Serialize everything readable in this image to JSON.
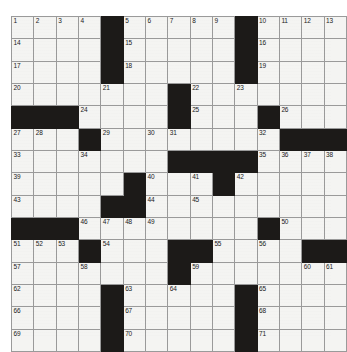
{
  "puzzle": {
    "type": "crossword-grid",
    "rows": 15,
    "cols": 15,
    "colors": {
      "block": "#1c1a18",
      "cell": "#f4f4f2",
      "grid_line": "#9a9a9a",
      "number_text": "#1a1a1a",
      "page_background": "#ffffff"
    },
    "grid": [
      [
        "1",
        "2",
        "3",
        "4",
        "#",
        "5",
        "6",
        "7",
        "8",
        "9",
        "#",
        "10",
        "11",
        "12",
        "13"
      ],
      [
        "14",
        "",
        "",
        "",
        "#",
        "15",
        "",
        "",
        "",
        "",
        "#",
        "16",
        "",
        "",
        ""
      ],
      [
        "17",
        "",
        "",
        "",
        "#",
        "18",
        "",
        "",
        "",
        "",
        "#",
        "19",
        "",
        "",
        ""
      ],
      [
        "20",
        "",
        "",
        "",
        "21",
        "",
        "",
        "#",
        "22",
        "",
        "23",
        "",
        "",
        "",
        ""
      ],
      [
        "#",
        "#",
        "#",
        "24",
        "",
        "",
        "",
        "#",
        "25",
        "",
        "",
        "#",
        "26",
        "",
        ""
      ],
      [
        "27",
        "28",
        "",
        "#",
        "29",
        "",
        "30",
        "31",
        "",
        "",
        "",
        "32",
        "#",
        "#",
        "#"
      ],
      [
        "33",
        "",
        "",
        "34",
        "",
        "",
        "",
        "#",
        "#",
        "#",
        "#",
        "35",
        "36",
        "37",
        "38"
      ],
      [
        "39",
        "",
        "",
        "",
        "",
        "#",
        "40",
        "",
        "41",
        "#",
        "42",
        "",
        "",
        "",
        ""
      ],
      [
        "43",
        "",
        "",
        "",
        "#",
        "#",
        "44",
        "",
        "45",
        "",
        "",
        "",
        "",
        "",
        ""
      ],
      [
        "#",
        "#",
        "#",
        "46",
        "47",
        "48",
        "49",
        "",
        "",
        "",
        "",
        "#",
        "50",
        "",
        ""
      ],
      [
        "51",
        "52",
        "53",
        "#",
        "54",
        "",
        "",
        "#",
        "#",
        "55",
        "",
        "56",
        "",
        "#",
        "#"
      ],
      [
        "57",
        "",
        "",
        "58",
        "",
        "",
        "",
        "#",
        "59",
        "",
        "",
        "",
        "",
        "60",
        "61"
      ],
      [
        "62",
        "",
        "",
        "",
        "#",
        "63",
        "",
        "64",
        "",
        "",
        "#",
        "65",
        "",
        "",
        ""
      ],
      [
        "66",
        "",
        "",
        "",
        "#",
        "67",
        "",
        "",
        "",
        "",
        "#",
        "68",
        "",
        "",
        ""
      ],
      [
        "69",
        "",
        "",
        "",
        "#",
        "70",
        "",
        "",
        "",
        "",
        "#",
        "71",
        "",
        "",
        ""
      ]
    ],
    "numbers_in_reading_order": [
      "1",
      "2",
      "3",
      "4",
      "5",
      "6",
      "7",
      "8",
      "9",
      "10",
      "11",
      "12",
      "13",
      "14",
      "15",
      "16",
      "17",
      "18",
      "19",
      "20",
      "21",
      "22",
      "23",
      "24",
      "25",
      "26",
      "27",
      "28",
      "29",
      "30",
      "31",
      "32",
      "33",
      "34",
      "35",
      "36",
      "37",
      "38",
      "39",
      "40",
      "41",
      "42",
      "43",
      "44",
      "45",
      "46",
      "47",
      "48",
      "49",
      "50",
      "51",
      "52",
      "53",
      "54",
      "55",
      "56",
      "57",
      "58",
      "59",
      "60",
      "61",
      "62",
      "63",
      "64",
      "65",
      "66",
      "67",
      "68",
      "69",
      "70",
      "71"
    ]
  }
}
